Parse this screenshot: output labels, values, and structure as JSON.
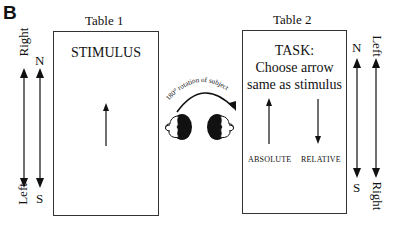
{
  "panel_label": "B",
  "table1": {
    "title": "Table 1",
    "heading": "STIMULUS",
    "arrow_direction": "up"
  },
  "table2": {
    "title": "Table 2",
    "heading_lines": [
      "TASK:",
      "Choose arrow",
      "same as stimulus"
    ],
    "choices": [
      {
        "label": "ABSOLUTE",
        "arrow_direction": "up"
      },
      {
        "label": "RELATIVE",
        "arrow_direction": "down"
      }
    ]
  },
  "rotation": {
    "label": "180° rotation of subject"
  },
  "left_axes": {
    "outer": {
      "top": "Right",
      "bottom": "Left"
    },
    "inner": {
      "top": "N",
      "bottom": "S"
    }
  },
  "right_axes": {
    "inner": {
      "top": "N",
      "bottom": "S"
    },
    "outer": {
      "top": "Left",
      "bottom": "Right"
    }
  },
  "colors": {
    "ink": "#111111",
    "line": "#333333",
    "background": "#ffffff"
  }
}
